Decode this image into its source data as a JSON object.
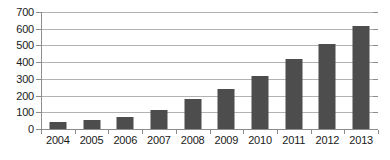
{
  "chart_data": {
    "type": "bar",
    "title": "",
    "subtitle": "",
    "xlabel": "",
    "ylabel": "",
    "categories": [
      "2004",
      "2005",
      "2006",
      "2007",
      "2008",
      "2009",
      "2010",
      "2011",
      "2012",
      "2013"
    ],
    "values": [
      40,
      55,
      70,
      115,
      180,
      240,
      315,
      420,
      510,
      615
    ],
    "ylim": [
      0,
      700
    ],
    "y_ticks": [
      0,
      100,
      200,
      300,
      400,
      500,
      600,
      700
    ],
    "y_tick_labels": [
      "0",
      "100",
      "200",
      "300",
      "400",
      "500",
      "600",
      "700"
    ],
    "grid": true,
    "legend": false,
    "legend_position": "none",
    "annotations": [],
    "colors": {
      "bar": "#4d4d4d",
      "gridline": "#b3b3b3",
      "axis": "#8c8c8c",
      "background": "#ffffff",
      "text": "#1a1a1a"
    }
  }
}
